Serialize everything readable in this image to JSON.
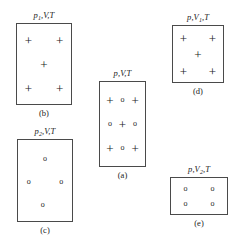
{
  "figure": {
    "background_color": "#ffffff",
    "box_border_color": "#4a4a4a",
    "symbol_color": "#1a1a1a"
  },
  "symbols": {
    "plus": "+",
    "circle": "o"
  },
  "panels": [
    {
      "id": "a",
      "caption": "(a)",
      "state_label": {
        "pressure": "p",
        "pressure_sub": "",
        "volume": "V",
        "volume_sub": "",
        "temperature": "T",
        "full_text": "p,V,T"
      },
      "box": {
        "x": 99,
        "y": 81,
        "width": 47,
        "height": 86
      },
      "particles": [
        {
          "type": "plus",
          "symbol": "+",
          "x": 22,
          "y": 22
        },
        {
          "type": "circle",
          "symbol": "o",
          "x": 50,
          "y": 22
        },
        {
          "type": "plus",
          "symbol": "+",
          "x": 78,
          "y": 22
        },
        {
          "type": "circle",
          "symbol": "o",
          "x": 22,
          "y": 50
        },
        {
          "type": "plus",
          "symbol": "+",
          "x": 50,
          "y": 50
        },
        {
          "type": "circle",
          "symbol": "o",
          "x": 78,
          "y": 50
        },
        {
          "type": "plus",
          "symbol": "+",
          "x": 22,
          "y": 78
        },
        {
          "type": "circle",
          "symbol": "o",
          "x": 50,
          "y": 78
        },
        {
          "type": "plus",
          "symbol": "+",
          "x": 78,
          "y": 78
        }
      ],
      "counts": {
        "plus": 5,
        "circle": 4
      }
    },
    {
      "id": "b",
      "caption": "(b)",
      "state_label": {
        "pressure": "p",
        "pressure_sub": "1",
        "volume": "V",
        "volume_sub": "",
        "temperature": "T",
        "full_text": "p1,V,T"
      },
      "box": {
        "x": 16,
        "y": 23,
        "width": 56,
        "height": 82
      },
      "particles": [
        {
          "type": "plus",
          "symbol": "+",
          "x": 21,
          "y": 20
        },
        {
          "type": "plus",
          "symbol": "+",
          "x": 79,
          "y": 20
        },
        {
          "type": "plus",
          "symbol": "+",
          "x": 50,
          "y": 50
        },
        {
          "type": "plus",
          "symbol": "+",
          "x": 21,
          "y": 80
        },
        {
          "type": "plus",
          "symbol": "+",
          "x": 79,
          "y": 80
        }
      ],
      "counts": {
        "plus": 5,
        "circle": 0
      }
    },
    {
      "id": "c",
      "caption": "(c)",
      "state_label": {
        "pressure": "p",
        "pressure_sub": "2",
        "volume": "V",
        "volume_sub": "",
        "temperature": "T",
        "full_text": "p2,V,T"
      },
      "box": {
        "x": 17,
        "y": 139,
        "width": 56,
        "height": 83
      },
      "particles": [
        {
          "type": "circle",
          "symbol": "o",
          "x": 50,
          "y": 23
        },
        {
          "type": "circle",
          "symbol": "o",
          "x": 20,
          "y": 52
        },
        {
          "type": "circle",
          "symbol": "o",
          "x": 80,
          "y": 52
        },
        {
          "type": "circle",
          "symbol": "o",
          "x": 46,
          "y": 80
        }
      ],
      "counts": {
        "plus": 0,
        "circle": 4
      }
    },
    {
      "id": "d",
      "caption": "(d)",
      "state_label": {
        "pressure": "p",
        "pressure_sub": "",
        "volume": "V",
        "volume_sub": "1",
        "temperature": "T",
        "full_text": "p,V1,T"
      },
      "box": {
        "x": 172,
        "y": 25,
        "width": 52,
        "height": 58
      },
      "particles": [
        {
          "type": "plus",
          "symbol": "+",
          "x": 21,
          "y": 21
        },
        {
          "type": "plus",
          "symbol": "+",
          "x": 79,
          "y": 21
        },
        {
          "type": "plus",
          "symbol": "+",
          "x": 50,
          "y": 50
        },
        {
          "type": "plus",
          "symbol": "+",
          "x": 21,
          "y": 80
        },
        {
          "type": "plus",
          "symbol": "+",
          "x": 79,
          "y": 80
        }
      ],
      "counts": {
        "plus": 5,
        "circle": 0
      }
    },
    {
      "id": "e",
      "caption": "(e)",
      "state_label": {
        "pressure": "p",
        "pressure_sub": "",
        "volume": "V",
        "volume_sub": "2",
        "temperature": "T",
        "full_text": "p,V2,T"
      },
      "box": {
        "x": 170,
        "y": 177,
        "width": 58,
        "height": 38
      },
      "particles": [
        {
          "type": "circle",
          "symbol": "o",
          "x": 26,
          "y": 30
        },
        {
          "type": "circle",
          "symbol": "o",
          "x": 74,
          "y": 30
        },
        {
          "type": "circle",
          "symbol": "o",
          "x": 26,
          "y": 72
        },
        {
          "type": "circle",
          "symbol": "o",
          "x": 74,
          "y": 72
        }
      ],
      "counts": {
        "plus": 0,
        "circle": 4
      }
    }
  ]
}
